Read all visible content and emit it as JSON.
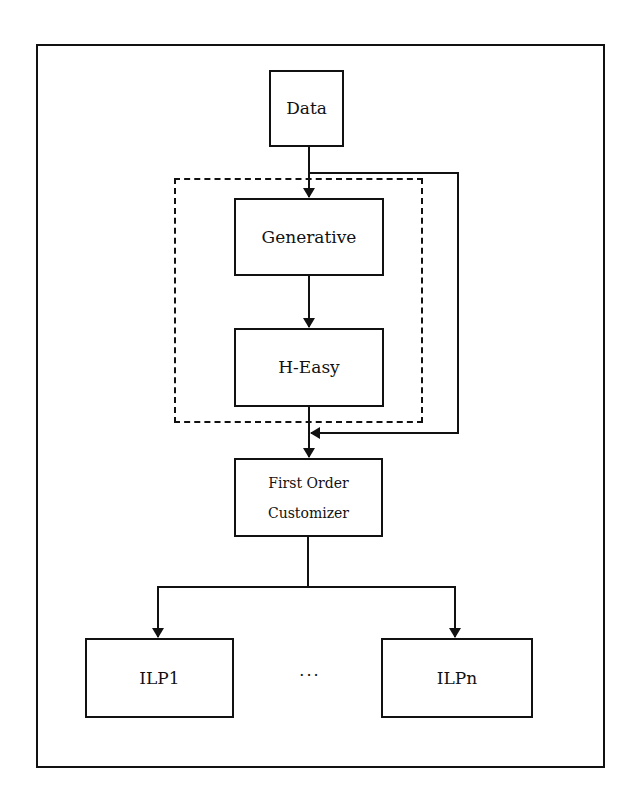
{
  "diagram": {
    "nodes": {
      "data": {
        "label": "Data"
      },
      "generative": {
        "label": "Generative"
      },
      "heasy": {
        "label": "H-Easy"
      },
      "first_order_customizer": {
        "line1": "First Order",
        "line2": "Customizer"
      },
      "ilp1": {
        "label": "ILP1"
      },
      "ilpn": {
        "label": "ILPn"
      }
    },
    "ellipsis": "···",
    "group": {
      "style": "dashed",
      "contains": [
        "Generative",
        "H-Easy"
      ]
    },
    "edges": [
      {
        "from": "Data",
        "to": "Generative"
      },
      {
        "from": "Generative",
        "to": "H-Easy"
      },
      {
        "from": "H-Easy",
        "to": "First Order Customizer"
      },
      {
        "from": "Data",
        "to": "First Order Customizer",
        "note": "bypass line on right"
      },
      {
        "from": "First Order Customizer",
        "to": "ILP1"
      },
      {
        "from": "First Order Customizer",
        "to": "ILPn"
      }
    ],
    "colors": {
      "stroke": "#111111",
      "background": "#ffffff"
    }
  }
}
